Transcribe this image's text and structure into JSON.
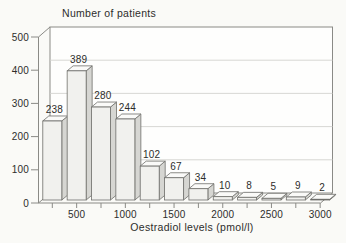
{
  "page": {
    "background": "#fafaf7"
  },
  "chart_data": {
    "type": "bar",
    "projection": "pseudo-3d",
    "title": "Number of patients",
    "xlabel": "Oestradiol levels (pmol/l)",
    "values": [
      238,
      389,
      280,
      244,
      102,
      67,
      34,
      10,
      8,
      5,
      9,
      2
    ],
    "bin_width_pmol": 250,
    "x_range": [
      0,
      3000
    ],
    "x_tick_labels": [
      "500",
      "1000",
      "1500",
      "2000",
      "2500",
      "3000"
    ],
    "y_ticks": [
      0,
      100,
      200,
      300,
      400,
      500
    ],
    "y_tick_labels": [
      "0",
      "100",
      "200",
      "300",
      "400",
      "500"
    ],
    "ylim": [
      0,
      500
    ],
    "grid": "horizontal-back-wall",
    "legend": "none",
    "data_labels_shown": true,
    "colors": {
      "bar_front": "#f1f1ee",
      "bar_side": "#d6d6d2",
      "bar_top": "#fafaf8",
      "bar_outline": "#6f6f6b",
      "frame": "#8a8a86",
      "gridline": "#d3d3cf",
      "wall_fill": "#fefefd",
      "text": "#2d2d2b",
      "background": "#fafaf7"
    }
  }
}
